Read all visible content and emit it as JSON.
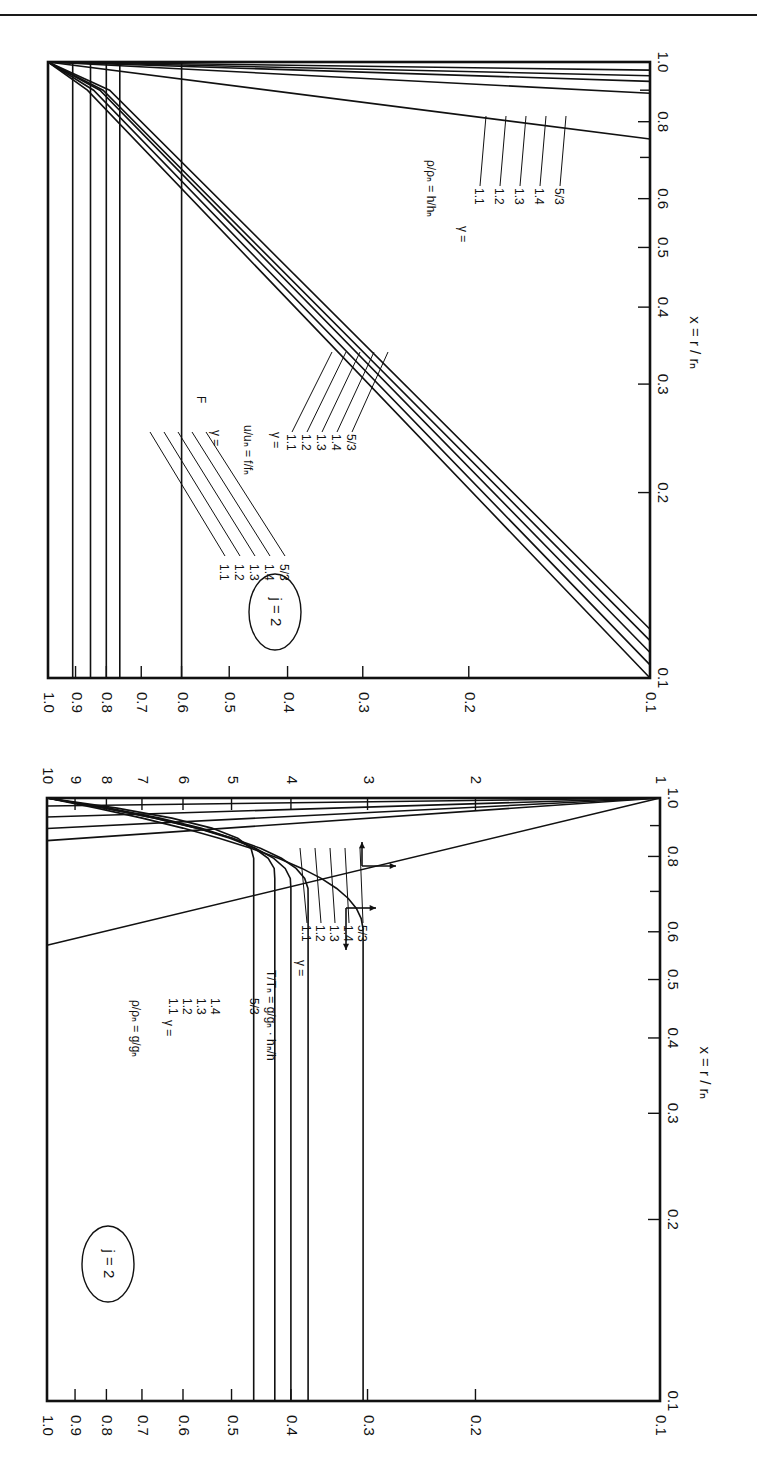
{
  "page": {
    "orientation": "figure rotated 90 degrees clockwise; two log-log panels stacked vertically"
  },
  "chart_data": [
    {
      "type": "line",
      "panel": "top",
      "annotation": "j = 2",
      "xlabel": "x = r / r_n",
      "ylabel": "",
      "xscale": "log",
      "yscale": "log",
      "xlim": [
        0.1,
        1.0
      ],
      "ylim": [
        0.1,
        1.0
      ],
      "x_ticks": [
        "0.1",
        "0.2",
        "0.3",
        "0.4",
        "0.5",
        "0.6",
        "0.8",
        "1.0"
      ],
      "y_ticks": [
        "0.1",
        "0.2",
        "0.3",
        "0.4",
        "0.5",
        "0.6",
        "0.7",
        "0.8",
        "0.9",
        "1.0"
      ],
      "legend_groups": [
        {
          "label": "F",
          "gamma_label": "γ =",
          "gammas": [
            "1.1",
            "1.2",
            "1.3",
            "1.4",
            "5/3"
          ]
        },
        {
          "label": "u/u_n = f/f_n",
          "gamma_label": "γ =",
          "gammas": [
            "1.1",
            "1.2",
            "1.3",
            "1.4",
            "5/3"
          ]
        },
        {
          "label": "ρ/ρ_n = h/h_n",
          "gamma_label": "γ =",
          "gammas": [
            "1.1",
            "1.2",
            "1.3",
            "1.4",
            "5/3"
          ]
        }
      ],
      "series": [
        {
          "name": "F, γ=1.1",
          "x": [
            0.1,
            1.0
          ],
          "y": [
            0.91,
            0.91
          ]
        },
        {
          "name": "F, γ=1.2",
          "x": [
            0.1,
            1.0
          ],
          "y": [
            0.85,
            0.85
          ]
        },
        {
          "name": "F, γ=1.3",
          "x": [
            0.1,
            1.0
          ],
          "y": [
            0.8,
            0.8
          ]
        },
        {
          "name": "F, γ=1.4",
          "x": [
            0.1,
            1.0
          ],
          "y": [
            0.76,
            0.76
          ]
        },
        {
          "name": "F, γ=5/3",
          "x": [
            0.1,
            1.0
          ],
          "y": [
            0.6,
            0.6
          ]
        },
        {
          "name": "u/u_n, γ=1.1",
          "x": [
            0.1,
            0.9,
            1.0
          ],
          "y": [
            0.1,
            0.86,
            1.0
          ]
        },
        {
          "name": "u/u_n, γ=1.2",
          "x": [
            0.105,
            0.9,
            1.0
          ],
          "y": [
            0.1,
            0.84,
            1.0
          ]
        },
        {
          "name": "u/u_n, γ=1.3",
          "x": [
            0.11,
            0.9,
            1.0
          ],
          "y": [
            0.1,
            0.82,
            1.0
          ]
        },
        {
          "name": "u/u_n, γ=1.4",
          "x": [
            0.115,
            0.9,
            1.0
          ],
          "y": [
            0.1,
            0.81,
            1.0
          ]
        },
        {
          "name": "u/u_n, γ=5/3",
          "x": [
            0.12,
            0.9,
            1.0
          ],
          "y": [
            0.1,
            0.79,
            1.0
          ]
        },
        {
          "name": "ρ/ρ_n, γ=1.1",
          "x": [
            0.97,
            1.0
          ],
          "y": [
            0.1,
            1.0
          ]
        },
        {
          "name": "ρ/ρ_n, γ=1.2",
          "x": [
            0.95,
            1.0
          ],
          "y": [
            0.1,
            1.0
          ]
        },
        {
          "name": "ρ/ρ_n, γ=1.3",
          "x": [
            0.93,
            1.0
          ],
          "y": [
            0.1,
            1.0
          ]
        },
        {
          "name": "ρ/ρ_n, γ=1.4",
          "x": [
            0.89,
            1.0
          ],
          "y": [
            0.1,
            1.0
          ]
        },
        {
          "name": "ρ/ρ_n, γ=5/3",
          "x": [
            0.75,
            1.0
          ],
          "y": [
            0.1,
            1.0
          ]
        }
      ],
      "labels": {
        "annotation": "j = 2",
        "xaxis": "x =",
        "xaxis_num": "r",
        "xaxis_den": "r",
        "xaxis_sub": "n",
        "F": "F",
        "gamma_eq": "γ =",
        "g11": "1.1",
        "g12": "1.2",
        "g13": "1.3",
        "g14": "1.4",
        "g53": "5/3",
        "u_label": "u/uₙ = f/fₙ",
        "rho_label": "ρ/ρₙ = h/hₙ"
      }
    },
    {
      "type": "line",
      "panel": "bottom",
      "annotation": "j = 2",
      "xlabel": "x = r / r_n",
      "xscale": "log",
      "yscale": "log",
      "xlim": [
        0.1,
        1.0
      ],
      "ylim_left_axis": [
        0.1,
        1.0
      ],
      "ylim_right_axis": [
        1,
        10
      ],
      "x_ticks": [
        "0.1",
        "0.2",
        "0.3",
        "0.4",
        "0.5",
        "0.6",
        "0.8",
        "1.0"
      ],
      "y_ticks_lower": [
        "0.1",
        "0.2",
        "0.3",
        "0.4",
        "0.5",
        "0.6",
        "0.7",
        "0.8",
        "0.9",
        "1.0"
      ],
      "y_ticks_upper": [
        "1",
        "2",
        "3",
        "4",
        "5",
        "6",
        "7",
        "8",
        "9",
        "10"
      ],
      "legend_groups": [
        {
          "label": "ρ/ρ_n = g/g_n",
          "gamma_label": "γ =",
          "gammas": [
            "1.1",
            "1.2",
            "1.3",
            "1.4",
            "5/3"
          ],
          "axis": "lower"
        },
        {
          "label": "T/T_n = g/g_n · h_n/h",
          "gamma_label": "γ =",
          "gammas": [
            "1.1",
            "1.2",
            "1.3",
            "1.4",
            "5/3"
          ],
          "axis": "upper"
        }
      ],
      "series": [
        {
          "name": "ρ/ρ_n, γ=1.1",
          "x": [
            0.1,
            0.8,
            0.9,
            1.0
          ],
          "y": [
            0.46,
            0.46,
            0.6,
            1.0
          ]
        },
        {
          "name": "ρ/ρ_n, γ=1.2",
          "x": [
            0.1,
            0.75,
            0.88,
            1.0
          ],
          "y": [
            0.425,
            0.425,
            0.6,
            1.0
          ]
        },
        {
          "name": "ρ/ρ_n, γ=1.3",
          "x": [
            0.1,
            0.72,
            0.87,
            1.0
          ],
          "y": [
            0.4,
            0.4,
            0.6,
            1.0
          ]
        },
        {
          "name": "ρ/ρ_n, γ=1.4",
          "x": [
            0.1,
            0.7,
            0.86,
            1.0
          ],
          "y": [
            0.375,
            0.375,
            0.6,
            1.0
          ]
        },
        {
          "name": "ρ/ρ_n, γ=5/3",
          "x": [
            0.1,
            0.45,
            0.6,
            0.8,
            1.0
          ],
          "y": [
            0.305,
            0.31,
            0.35,
            0.5,
            1.0
          ]
        },
        {
          "name": "T/T_n, γ=1.1",
          "x": [
            0.97,
            1.0
          ],
          "y": [
            10,
            1
          ]
        },
        {
          "name": "T/T_n, γ=1.2",
          "x": [
            0.93,
            1.0
          ],
          "y": [
            10,
            1
          ]
        },
        {
          "name": "T/T_n, γ=1.3",
          "x": [
            0.89,
            1.0
          ],
          "y": [
            10,
            1
          ]
        },
        {
          "name": "T/T_n, γ=1.4",
          "x": [
            0.85,
            1.0
          ],
          "y": [
            10,
            1
          ]
        },
        {
          "name": "T/T_n, γ=5/3",
          "x": [
            0.57,
            1.0
          ],
          "y": [
            10,
            1
          ]
        }
      ],
      "labels": {
        "annotation": "j = 2",
        "xaxis": "x =",
        "rho_label": "ρ/ρₙ = g/gₙ",
        "T_label": "T/Tₙ = g/gₙ · hₙ/h",
        "gamma_eq": "γ =",
        "g11": "1.1",
        "g12": "1.2",
        "g13": "1.3",
        "g14": "1.4",
        "g53": "5/3"
      }
    }
  ]
}
